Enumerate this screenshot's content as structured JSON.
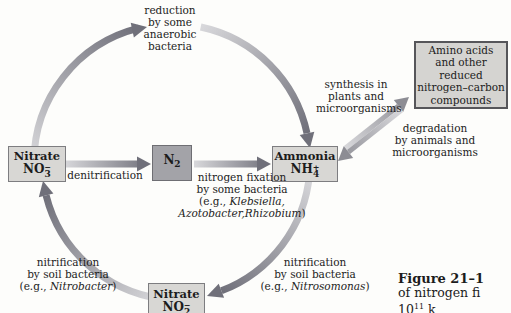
{
  "boxes": {
    "nitrate": {
      "name": "Nitrate",
      "formula_base": "NO",
      "formula_sub": "3",
      "formula_sign": "−"
    },
    "n2": {
      "formula_base": "N",
      "formula_sub": "2"
    },
    "ammonia": {
      "name": "Ammonia",
      "formula_base": "NH",
      "formula_sub": "4",
      "formula_sign": "+"
    },
    "nitrite": {
      "name": "Nitrate",
      "formula_base": "NO",
      "formula_sub": "2",
      "formula_sign": "−"
    },
    "amino": {
      "line1": "Amino acids",
      "line2": "and other",
      "line3": "reduced",
      "line4": "nitrogen–carbon",
      "line5": "compounds"
    }
  },
  "labels": {
    "reduction": {
      "line1": "reduction",
      "line2": "by some",
      "line3": "anaerobic",
      "line4": "bacteria"
    },
    "denitrification": "denitrification",
    "fixation": {
      "line1": "nitrogen fixation",
      "line2": "by some bacteria",
      "line3_prefix": "(e.g., ",
      "line3_species": "Klebsiella,",
      "line4_species": "Azotobacter,Rhizobium",
      "line4_suffix": ")"
    },
    "synthesis": {
      "line1": "synthesis in",
      "line2": "plants and",
      "line3": "microorganisms"
    },
    "degradation": {
      "line1": "degradation",
      "line2": "by animals and",
      "line3": "microorganisms"
    },
    "nitrification_left": {
      "line1": "nitrification",
      "line2": "by soil bacteria",
      "line3_prefix": "(e.g., ",
      "line3_species": "Nitrobacter",
      "line3_suffix": ")"
    },
    "nitrification_right": {
      "line1": "nitrification",
      "line2": "by soil bacteria",
      "line3_prefix": "(e.g., ",
      "line3_species": "Nitrosomonas",
      "line3_suffix": ")"
    }
  },
  "figure": {
    "caption_title": "Figure 21–1",
    "caption_line2": "of nitrogen fi",
    "caption_line3_base": "10",
    "caption_line3_sup": "11",
    "caption_line3_rest": " k"
  },
  "colors": {
    "bg": "#fdfdfb",
    "ink": "#1c1c1c",
    "box-fill": "#d8d7d4",
    "box-border": "#7d7d80",
    "n2-fill": "#a3a3a8",
    "n2-border": "#6e6e73",
    "amino-fill": "#d5d4d1",
    "amino-border": "#56565a",
    "arrow-light": "#d8d8db",
    "arrow-dark": "#70707a",
    "arrow-mid": "#8d8d94"
  }
}
